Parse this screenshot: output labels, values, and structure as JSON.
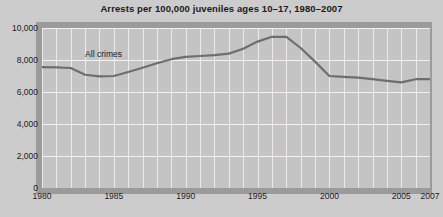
{
  "chart_data": {
    "type": "line",
    "title": "Arrests per 100,000 juveniles ages 10–17, 1980–2007",
    "xlabel": "",
    "ylabel": "",
    "xlim": [
      1980,
      2007
    ],
    "ylim": [
      0,
      10000
    ],
    "grid": true,
    "legend_position": "inline-annotation",
    "y_ticks": [
      0,
      2000,
      4000,
      6000,
      8000,
      10000
    ],
    "y_tick_labels": [
      "0",
      "2,000",
      "4,000",
      "6,000",
      "8,000",
      "10,000"
    ],
    "x_ticks": [
      1980,
      1985,
      1990,
      1995,
      2000,
      2005,
      2007
    ],
    "x_tick_labels": [
      "1980",
      "1985",
      "1990",
      "1995",
      "2000",
      "2005",
      "2007"
    ],
    "annotations": [
      {
        "text": "All crimes",
        "x": 1983,
        "y": 8700
      }
    ],
    "series": [
      {
        "name": "All crimes",
        "color": "#6e6e6e",
        "x": [
          1980,
          1981,
          1982,
          1983,
          1984,
          1985,
          1986,
          1987,
          1988,
          1989,
          1990,
          1991,
          1992,
          1993,
          1994,
          1995,
          1996,
          1997,
          1998,
          1999,
          2000,
          2001,
          2002,
          2003,
          2004,
          2005,
          2006,
          2007
        ],
        "values": [
          7560,
          7540,
          7500,
          7080,
          6980,
          7000,
          7250,
          7520,
          7800,
          8050,
          8200,
          8250,
          8300,
          8400,
          8700,
          9150,
          9450,
          9450,
          8750,
          7900,
          7000,
          6950,
          6900,
          6800,
          6700,
          6600,
          6800,
          6800
        ]
      }
    ]
  },
  "axis": {
    "y_title": "",
    "x_title": ""
  }
}
